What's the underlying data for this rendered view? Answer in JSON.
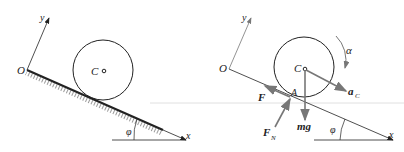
{
  "left_panel": {
    "labels": {
      "origin": "O",
      "y_axis": "y",
      "x_axis": "x",
      "center": "C",
      "angle": "φ"
    }
  },
  "right_panel": {
    "labels": {
      "origin": "O",
      "y_axis": "y",
      "x_axis": "x",
      "center": "C",
      "angle": "φ",
      "contact_point": "A",
      "friction_force": "F",
      "normal_force": "F",
      "normal_force_sub": "N",
      "gravity": "mg",
      "acceleration": "a",
      "acceleration_sub": "C",
      "angular_acceleration": "α"
    }
  },
  "colors": {
    "line": "#222222",
    "force_arrow": "#777777",
    "hatch": "#333333",
    "guide_line": "#d8d8d8"
  }
}
